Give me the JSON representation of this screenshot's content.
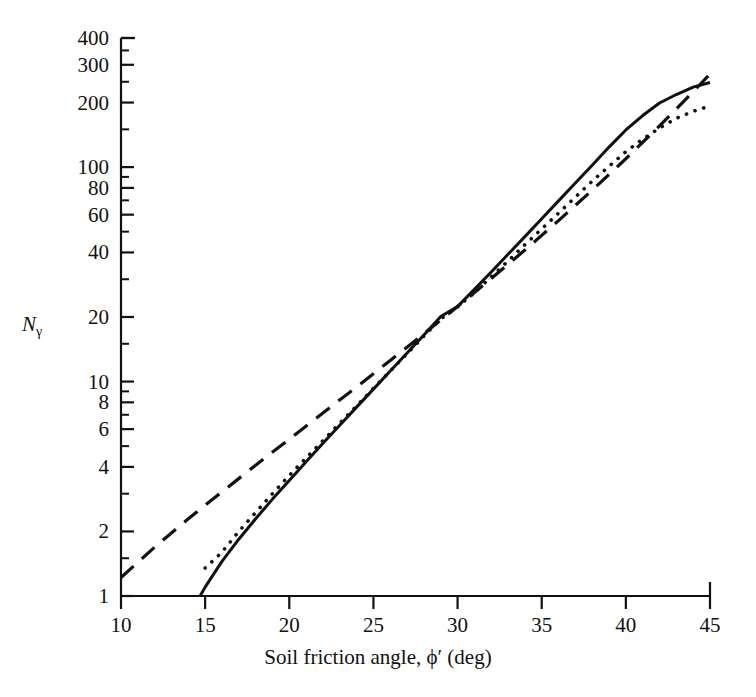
{
  "figure": {
    "background": "#ffffff",
    "ink": "#111111"
  },
  "chart_data": {
    "type": "line",
    "title": "",
    "subtitle": "",
    "xlabel": "Soil friction angle, ϕ′ (deg)",
    "ylabel": "Nγ",
    "ylabel_base": "N",
    "ylabel_sub": "γ",
    "xscale": "linear",
    "yscale": "log",
    "xlim": [
      10,
      45
    ],
    "ylim": [
      1,
      400
    ],
    "grid": false,
    "legend": "none",
    "xticks": [
      10,
      15,
      20,
      25,
      30,
      35,
      40,
      45
    ],
    "xticklabels": [
      "10",
      "15",
      "20",
      "25",
      "30",
      "35",
      "40",
      "45"
    ],
    "yticks": [
      1,
      2,
      4,
      6,
      8,
      10,
      20,
      40,
      60,
      80,
      100,
      200,
      300,
      400
    ],
    "yticklabels": [
      "1",
      "2",
      "4",
      "6",
      "8",
      "10",
      "20",
      "40",
      "60",
      "80",
      "100",
      "200",
      "300",
      "400"
    ],
    "y_minor_ticks": [
      1.5,
      3,
      5,
      7,
      9,
      15,
      30,
      50,
      70,
      90,
      150,
      250,
      350
    ],
    "series": [
      {
        "name": "dashed-curve",
        "style": "dashed",
        "color": "#111111",
        "linewidth": 3.2,
        "x": [
          10,
          12,
          14,
          15,
          16,
          18,
          20,
          22,
          24,
          25,
          26,
          28,
          30,
          32,
          34,
          35,
          36,
          38,
          40,
          42,
          44,
          45
        ],
        "y": [
          1.22,
          1.69,
          2.29,
          2.65,
          3.06,
          4.07,
          5.39,
          7.13,
          9.44,
          10.88,
          12.54,
          16.72,
          22.4,
          30.22,
          41.06,
          48.03,
          56.31,
          78.03,
          109.41,
          155.55,
          224.64,
          271.76
        ]
      },
      {
        "name": "solid-curve",
        "style": "solid",
        "color": "#111111",
        "linewidth": 3.0,
        "x": [
          14.7,
          15,
          16,
          17,
          18,
          19,
          20,
          21,
          22,
          23,
          24,
          25,
          26,
          27,
          28,
          29,
          30,
          31,
          32,
          33,
          34,
          35,
          36,
          37,
          38,
          39,
          40,
          41,
          42,
          43,
          44,
          45
        ],
        "y": [
          1.0,
          1.1,
          1.45,
          1.84,
          2.29,
          2.83,
          3.46,
          4.23,
          5.15,
          6.25,
          7.6,
          9.22,
          11.2,
          13.6,
          16.5,
          20.1,
          22.4,
          26.9,
          32.4,
          39.2,
          47.4,
          57.4,
          69.6,
          84.3,
          102.0,
          124.0,
          149.0,
          174.0,
          199.0,
          218.0,
          236.0,
          248.0
        ]
      },
      {
        "name": "dotted-curve",
        "style": "dotted",
        "color": "#111111",
        "linewidth": 3.6,
        "x": [
          15,
          16,
          17,
          18,
          19,
          20,
          21,
          22,
          23,
          24,
          25,
          26,
          27,
          28,
          29,
          30,
          31,
          32,
          33,
          34,
          35,
          36,
          37,
          38,
          39,
          40,
          41,
          42,
          43,
          44,
          45
        ],
        "y": [
          1.35,
          1.6,
          2.0,
          2.45,
          3.0,
          3.65,
          4.4,
          5.3,
          6.4,
          7.7,
          9.3,
          11.2,
          13.5,
          16.3,
          19.6,
          22.3,
          26.0,
          30.8,
          36.5,
          43.5,
          51.5,
          61.0,
          72.5,
          86.0,
          101.0,
          118.0,
          135.0,
          152.0,
          169.0,
          182.0,
          193.0
        ]
      }
    ]
  }
}
